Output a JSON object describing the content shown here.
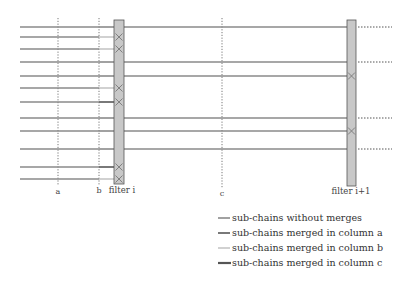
{
  "columns": [
    {
      "id": "a",
      "label": "a"
    },
    {
      "id": "b",
      "label": "b"
    },
    {
      "id": "c",
      "label": "c"
    }
  ],
  "filters": [
    {
      "id": "filter-i",
      "label": "filter i"
    },
    {
      "id": "filter-i+1",
      "label": "filter i+1"
    }
  ],
  "colors": {
    "without_merges": "#8a8a8a",
    "merged_a": "#6a6a6a",
    "merged_b": "#bdbdbd",
    "merged_c": "#555555",
    "filter_fill": "#c8c8c8",
    "filter_stroke": "#555555",
    "dotted": "#555555"
  },
  "chains": [
    {
      "row": 1,
      "left_type": "without_merges",
      "merge_at_filter_i": false,
      "continues": true,
      "merge_at_filter_i1": false,
      "passes_filter_i1": true
    },
    {
      "row": 2,
      "left_type": "merged_b",
      "merge_at_filter_i": true,
      "continues": false
    },
    {
      "row": 3,
      "left_type": "merged_b",
      "merge_at_filter_i": true,
      "continues": false
    },
    {
      "row": 4,
      "left_type": "without_merges",
      "merge_at_filter_i": false,
      "continues": true,
      "merge_at_filter_i1": false,
      "passes_filter_i1": true
    },
    {
      "row": 5,
      "left_type": "without_merges",
      "merge_at_filter_i": false,
      "continues": true,
      "merge_at_filter_i1": true,
      "passes_filter_i1": false
    },
    {
      "row": 6,
      "left_type": "merged_b",
      "merge_at_filter_i": true,
      "continues": false
    },
    {
      "row": 7,
      "left_type": "merged_a",
      "merge_at_filter_i": true,
      "continues": false
    },
    {
      "row": 8,
      "left_type": "without_merges",
      "merge_at_filter_i": false,
      "continues": true,
      "merge_at_filter_i1": false,
      "passes_filter_i1": true
    },
    {
      "row": 9,
      "left_type": "without_merges",
      "merge_at_filter_i": false,
      "continues": true,
      "merge_at_filter_i1": true,
      "passes_filter_i1": false
    },
    {
      "row": 10,
      "left_type": "without_merges",
      "merge_at_filter_i": false,
      "continues": true,
      "merge_at_filter_i1": false,
      "passes_filter_i1": true
    },
    {
      "row": 11,
      "left_type": "merged_a",
      "merge_at_filter_i": true,
      "continues": false
    },
    {
      "row": 12,
      "left_type": "merged_b",
      "merge_at_filter_i": true,
      "continues": false
    }
  ],
  "legend": [
    {
      "type": "without_merges",
      "label": "sub-chains without merges"
    },
    {
      "type": "merged_a",
      "label": "sub-chains merged in column a"
    },
    {
      "type": "merged_b",
      "label": "sub-chains merged in column b"
    },
    {
      "type": "merged_c",
      "label": "sub-chains merged in column c"
    }
  ]
}
